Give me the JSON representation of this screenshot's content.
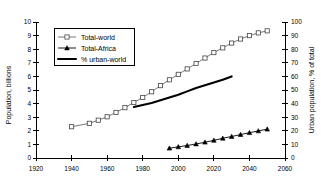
{
  "chart_data": {
    "type": "line",
    "title": "",
    "xlabel": "",
    "ylabel": "Population, billions",
    "y2label": "Urban population, % of total",
    "xlim": [
      1920,
      2060
    ],
    "ylim": [
      0,
      10
    ],
    "y2lim": [
      0,
      100
    ],
    "xticks": [
      1920,
      1940,
      1960,
      1980,
      2000,
      2020,
      2040,
      2060
    ],
    "xticklabels": [
      "1920",
      "1940",
      "1960",
      "1980",
      "2000",
      "2020",
      "2040",
      "2060"
    ],
    "yticks": [
      0,
      1,
      2,
      3,
      4,
      5,
      6,
      7,
      8,
      9,
      10
    ],
    "yticklabels": [
      "0",
      "1",
      "2",
      "3",
      "4",
      "5",
      "6",
      "7",
      "8",
      "9",
      "10"
    ],
    "y2ticks": [
      0,
      10,
      20,
      30,
      40,
      50,
      60,
      70,
      80,
      90,
      100
    ],
    "y2ticklabels": [
      "0",
      "10",
      "20",
      "30",
      "40",
      "50",
      "60",
      "70",
      "80",
      "90",
      "100"
    ],
    "grid": false,
    "legend_position": "upper-left",
    "series": [
      {
        "name": "Total-world",
        "axis": "left",
        "marker": "open-square",
        "x": [
          1940,
          1950,
          1955,
          1960,
          1965,
          1970,
          1975,
          1980,
          1985,
          1990,
          1995,
          2000,
          2005,
          2010,
          2015,
          2020,
          2025,
          2030,
          2035,
          2040,
          2045,
          2050
        ],
        "y": [
          2.3,
          2.55,
          2.78,
          3.03,
          3.35,
          3.7,
          4.08,
          4.45,
          4.87,
          5.32,
          5.75,
          6.15,
          6.55,
          6.95,
          7.35,
          7.75,
          8.1,
          8.45,
          8.75,
          9.0,
          9.2,
          9.35
        ]
      },
      {
        "name": "Total-Africa",
        "axis": "left",
        "marker": "filled-triangle",
        "x": [
          1995,
          2000,
          2005,
          2010,
          2015,
          2020,
          2025,
          2030,
          2035,
          2040,
          2045,
          2050
        ],
        "y": [
          0.72,
          0.82,
          0.92,
          1.03,
          1.16,
          1.3,
          1.45,
          1.58,
          1.72,
          1.86,
          1.99,
          2.12
        ]
      },
      {
        "name": "% urban-world",
        "axis": "right",
        "marker": "none",
        "x": [
          1975,
          1980,
          1985,
          1990,
          1995,
          2000,
          2005,
          2010,
          2015,
          2020,
          2025,
          2030
        ],
        "y": [
          37.5,
          39.0,
          40.5,
          42.5,
          44.5,
          46.5,
          49.0,
          51.5,
          53.5,
          55.5,
          57.5,
          60.0
        ]
      }
    ]
  },
  "legend": {
    "entries": [
      {
        "label": "Total-world",
        "swatch": "open-square-line"
      },
      {
        "label": "Total-Africa",
        "swatch": "filled-triangle-line"
      },
      {
        "label": "% urban-world",
        "swatch": "thick-line"
      }
    ]
  }
}
